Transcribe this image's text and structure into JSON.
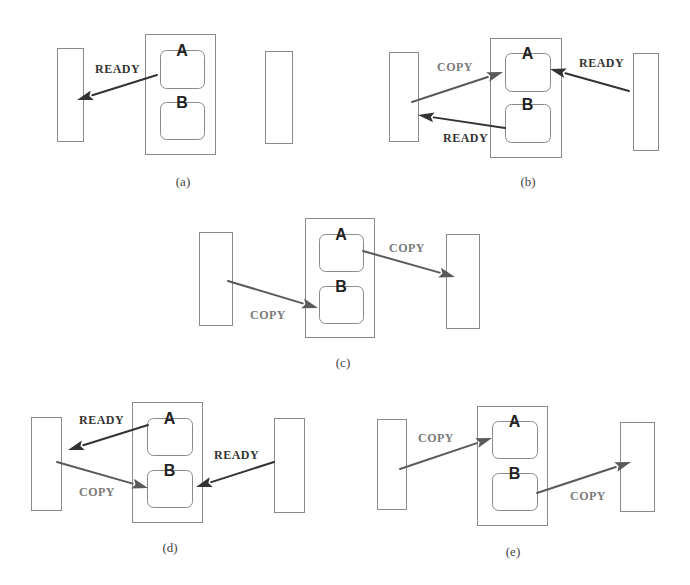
{
  "figure": {
    "colors": {
      "ready_arrow": "#333333",
      "copy_arrow": "#5a5a5a",
      "ready_text": "#333333",
      "copy_text": "#7a7a7a",
      "outline": "#8a8a8a"
    },
    "panels": [
      {
        "id": "a",
        "caption": "(a)",
        "caption_pos": [
          183,
          186
        ],
        "left_rect": [
          57,
          48,
          26,
          93
        ],
        "right_rect": [
          265,
          51,
          27,
          92
        ],
        "buffer_box": [
          145,
          34,
          70,
          120
        ],
        "slots": [
          {
            "name": "A",
            "rect": [
              160,
              50,
              44,
              38
            ]
          },
          {
            "name": "B",
            "rect": [
              160,
              102,
              44,
              37
            ]
          }
        ],
        "arrows": [
          {
            "kind": "ready",
            "label": "READY",
            "from": [
              157,
              75
            ],
            "to": [
              77,
              100
            ],
            "label_pos": [
              95,
              73
            ]
          }
        ]
      },
      {
        "id": "b",
        "caption": "(b)",
        "caption_pos": [
          528,
          186
        ],
        "left_rect": [
          389,
          52,
          29,
          89
        ],
        "right_rect": [
          633,
          53,
          25,
          97
        ],
        "buffer_box": [
          490,
          38,
          71,
          119
        ],
        "slots": [
          {
            "name": "A",
            "rect": [
              505,
              53,
              45,
              38
            ]
          },
          {
            "name": "B",
            "rect": [
              505,
              104,
              45,
              38
            ]
          }
        ],
        "arrows": [
          {
            "kind": "copy",
            "label": "COPY",
            "from": [
              412,
              102
            ],
            "to": [
              503,
              72
            ],
            "label_pos": [
              437,
              71
            ]
          },
          {
            "kind": "ready",
            "label": "READY",
            "from": [
              505,
              128
            ],
            "to": [
              418,
              115
            ],
            "label_pos": [
              443,
              142
            ]
          },
          {
            "kind": "ready",
            "label": "READY",
            "from": [
              629,
              91
            ],
            "to": [
              550,
              69
            ],
            "label_pos": [
              579,
              67
            ]
          }
        ]
      },
      {
        "id": "c",
        "caption": "(c)",
        "caption_pos": [
          343,
          367
        ],
        "left_rect": [
          199,
          232,
          33,
          93
        ],
        "right_rect": [
          446,
          234,
          33,
          94
        ],
        "buffer_box": [
          305,
          218,
          69,
          119
        ],
        "slots": [
          {
            "name": "A",
            "rect": [
              319,
              234,
              44,
              37
            ]
          },
          {
            "name": "B",
            "rect": [
              319,
              286,
              44,
              37
            ]
          }
        ],
        "arrows": [
          {
            "kind": "copy",
            "label": "COPY",
            "from": [
              228,
              281
            ],
            "to": [
              318,
              308
            ],
            "label_pos": [
              250,
              319
            ]
          },
          {
            "kind": "copy",
            "label": "COPY",
            "from": [
              363,
              251
            ],
            "to": [
              455,
              277
            ],
            "label_pos": [
              389,
              252
            ]
          }
        ]
      },
      {
        "id": "d",
        "caption": "(d)",
        "caption_pos": [
          170,
          552
        ],
        "left_rect": [
          31,
          417,
          30,
          93
        ],
        "right_rect": [
          274,
          418,
          30,
          94
        ],
        "buffer_box": [
          132,
          402,
          70,
          120
        ],
        "slots": [
          {
            "name": "A",
            "rect": [
              147,
              418,
              45,
              37
            ]
          },
          {
            "name": "B",
            "rect": [
              147,
              470,
              45,
              37
            ]
          }
        ],
        "arrows": [
          {
            "kind": "ready",
            "label": "READY",
            "from": [
              148,
              425
            ],
            "to": [
              68,
              450
            ],
            "label_pos": [
              79,
              424
            ]
          },
          {
            "kind": "copy",
            "label": "COPY",
            "from": [
              57,
              462
            ],
            "to": [
              148,
              488
            ],
            "label_pos": [
              79,
              496
            ]
          },
          {
            "kind": "ready",
            "label": "READY",
            "from": [
              274,
              462
            ],
            "to": [
              196,
              487
            ],
            "label_pos": [
              214,
              459
            ]
          }
        ]
      },
      {
        "id": "e",
        "caption": "(e)",
        "caption_pos": [
          513,
          556
        ],
        "left_rect": [
          377,
          419,
          29,
          90
        ],
        "right_rect": [
          620,
          422,
          34,
          89
        ],
        "buffer_box": [
          477,
          406,
          70,
          119
        ],
        "slots": [
          {
            "name": "A",
            "rect": [
              492,
              421,
              45,
              37
            ]
          },
          {
            "name": "B",
            "rect": [
              492,
              473,
              45,
              37
            ]
          }
        ],
        "arrows": [
          {
            "kind": "copy",
            "label": "COPY",
            "from": [
              400,
              469
            ],
            "to": [
              492,
              438
            ],
            "label_pos": [
              418,
              442
            ]
          },
          {
            "kind": "copy",
            "label": "COPY",
            "from": [
              537,
              493
            ],
            "to": [
              631,
              462
            ],
            "label_pos": [
              570,
              500
            ]
          }
        ]
      }
    ]
  }
}
